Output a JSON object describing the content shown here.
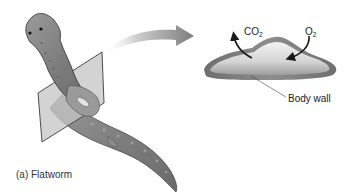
{
  "figure": {
    "caption": "(a) Flatworm",
    "panels": {
      "organism": {
        "name": "Flatworm",
        "features": [
          "eyespots",
          "cross-section plane",
          "pharynx"
        ]
      },
      "cross_section": {
        "label": "Body wall",
        "gas_out": {
          "base": "CO",
          "sub": "2"
        },
        "gas_in": {
          "base": "O",
          "sub": "2"
        }
      }
    },
    "colors": {
      "worm_body": "#8a8a8a",
      "worm_dark": "#5a5a5a",
      "plane": "#b9b9b9",
      "arrow": "#8c8c8c",
      "section_rim": "#7a7a7a",
      "section_inner": "#d8d8d8",
      "gas_arrow": "#1a1a1a"
    }
  }
}
